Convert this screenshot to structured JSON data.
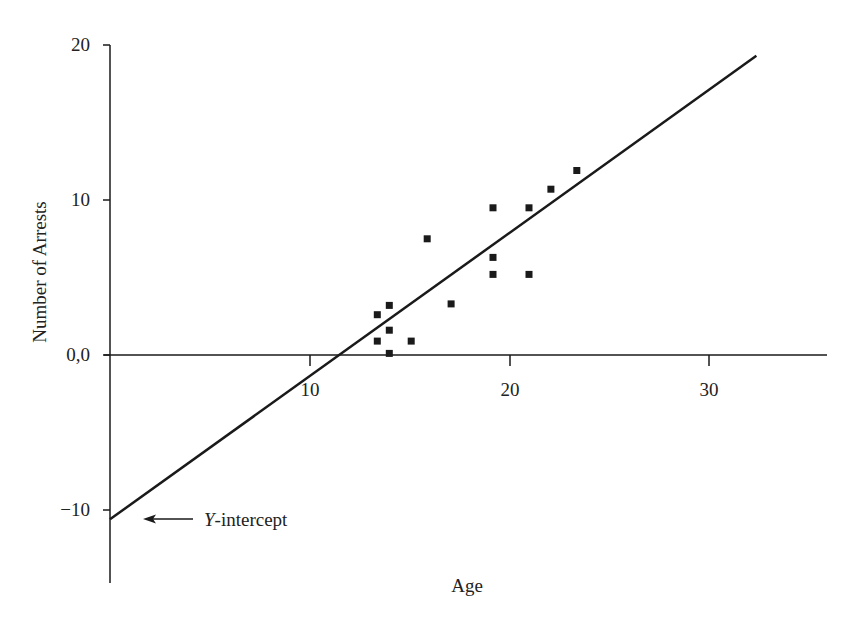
{
  "chart_data": {
    "type": "scatter",
    "title": "",
    "xlabel": "Age",
    "ylabel": "Number of Arrests",
    "xlim": [
      0,
      36
    ],
    "ylim": [
      -15,
      20
    ],
    "x_ticks": [
      10,
      20,
      30
    ],
    "x_tick_labels": [
      "10",
      "20",
      "30"
    ],
    "y_ticks": [
      20,
      10,
      0,
      -10
    ],
    "y_tick_labels": [
      "20",
      "10",
      "0,0",
      "−10"
    ],
    "grid": false,
    "legend": null,
    "series": [
      {
        "name": "Observed arrests",
        "marker": "square",
        "points": [
          {
            "x": 13.4,
            "y": 2.6
          },
          {
            "x": 14.0,
            "y": 3.2
          },
          {
            "x": 14.0,
            "y": 1.6
          },
          {
            "x": 13.4,
            "y": 0.9
          },
          {
            "x": 15.1,
            "y": 0.9
          },
          {
            "x": 14.0,
            "y": 0.1
          },
          {
            "x": 17.1,
            "y": 3.3
          },
          {
            "x": 15.9,
            "y": 7.5
          },
          {
            "x": 19.2,
            "y": 9.5
          },
          {
            "x": 21.0,
            "y": 9.5
          },
          {
            "x": 22.1,
            "y": 10.7
          },
          {
            "x": 23.4,
            "y": 11.9
          },
          {
            "x": 19.2,
            "y": 6.3
          },
          {
            "x": 19.2,
            "y": 5.2
          },
          {
            "x": 21.0,
            "y": 5.2
          }
        ]
      }
    ],
    "regression_line": {
      "name": "Regression line",
      "x0": 0,
      "y0": -10.6,
      "x1": 32.4,
      "y1": 19.3,
      "slope": 0.92,
      "intercept": -10.6
    },
    "annotations": [
      {
        "text_italic": "Y",
        "text_rest": "-intercept",
        "arrow_to": {
          "x": 0,
          "y": -10.6
        }
      }
    ]
  },
  "labels": {
    "xlabel": "Age",
    "ylabel": "Number of Arrests",
    "annotation_italic": "Y",
    "annotation_rest": "-intercept",
    "y_ticks": [
      "20",
      "10",
      "0,0",
      "−10"
    ],
    "x_ticks": [
      "10",
      "20",
      "30"
    ]
  },
  "colors": {
    "ink": "#1a1a1a",
    "background": "#ffffff"
  }
}
